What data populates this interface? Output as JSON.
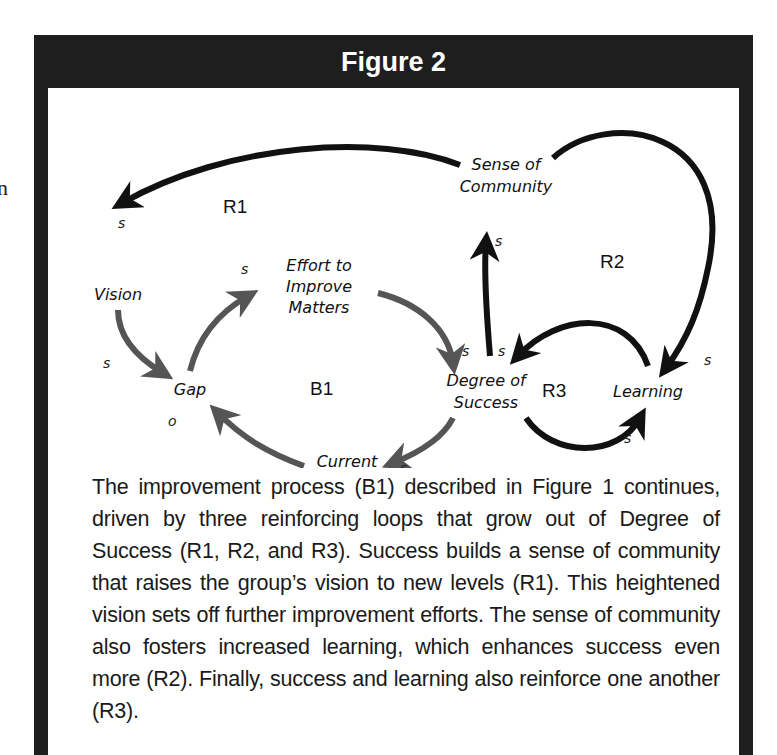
{
  "figure": {
    "title": "Figure 2",
    "stray_text": "n",
    "colors": {
      "frame": "#1e1e1e",
      "reinforcing_arrow": "#111111",
      "balancing_arrow": "#555555",
      "background": "#ffffff"
    },
    "nodes": [
      {
        "id": "vision",
        "lines": [
          "Vision"
        ],
        "x": 70,
        "y": 206
      },
      {
        "id": "effort",
        "lines": [
          "Effort to",
          "Improve",
          "Matters"
        ],
        "x": 258,
        "y": 193
      },
      {
        "id": "sense",
        "lines": [
          "Sense of",
          "Community"
        ],
        "x": 418,
        "y": 124
      },
      {
        "id": "gap",
        "lines": [
          "Gap"
        ],
        "x": 157,
        "y": 307
      },
      {
        "id": "degree",
        "lines": [
          "Degree of",
          "Success"
        ],
        "x": 406,
        "y": 307
      },
      {
        "id": "learning",
        "lines": [
          "Learning"
        ],
        "x": 584,
        "y": 313
      },
      {
        "id": "reality",
        "lines": [
          "Current",
          "Reality"
        ],
        "x": 288,
        "y": 376
      }
    ],
    "loops": [
      {
        "id": "R1",
        "label": "R1",
        "x": 200,
        "y": 147
      },
      {
        "id": "R2",
        "label": "R2",
        "x": 575,
        "y": 194
      },
      {
        "id": "B1",
        "label": "B1",
        "x": 280,
        "y": 312
      },
      {
        "id": "R3",
        "label": "R3",
        "x": 503,
        "y": 318
      }
    ],
    "links": [
      {
        "from": "sense",
        "to": "vision",
        "polarity": "s",
        "loop": "R1",
        "kind": "reinforcing"
      },
      {
        "from": "vision",
        "to": "gap",
        "polarity": "s",
        "loop": "B1",
        "kind": "balancing"
      },
      {
        "from": "gap",
        "to": "effort",
        "polarity": "s",
        "loop": "B1",
        "kind": "balancing"
      },
      {
        "from": "effort",
        "to": "degree",
        "polarity": "s",
        "loop": "B1",
        "kind": "balancing"
      },
      {
        "from": "degree",
        "to": "reality",
        "polarity": "s",
        "loop": "B1",
        "kind": "balancing"
      },
      {
        "from": "reality",
        "to": "gap",
        "polarity": "o",
        "loop": "B1",
        "kind": "balancing"
      },
      {
        "from": "degree",
        "to": "sense",
        "polarity": "s",
        "loop": "R1",
        "kind": "reinforcing"
      },
      {
        "from": "sense",
        "to": "learning",
        "polarity": "s",
        "loop": "R2",
        "kind": "reinforcing"
      },
      {
        "from": "learning",
        "to": "degree",
        "polarity": "s",
        "loop": "R3",
        "kind": "reinforcing"
      },
      {
        "from": "degree",
        "to": "learning",
        "polarity": "s",
        "loop": "R3",
        "kind": "reinforcing"
      }
    ],
    "polarity_labels": [
      {
        "text": "s",
        "x": 73,
        "y": 134
      },
      {
        "text": "s",
        "x": 187,
        "y": 177
      },
      {
        "text": "s",
        "x": 52,
        "y": 272
      },
      {
        "text": "o",
        "x": 117,
        "y": 332
      },
      {
        "text": "s",
        "x": 418,
        "y": 253
      },
      {
        "text": "s",
        "x": 405,
        "y": 282
      },
      {
        "text": "s",
        "x": 438,
        "y": 282
      },
      {
        "text": "s",
        "x": 645,
        "y": 298
      },
      {
        "text": "s",
        "x": 554,
        "y": 360
      },
      {
        "text": "s",
        "x": 337,
        "y": 371
      }
    ],
    "caption": "The improvement process (B1) described in Figure 1 continues, driven by three reinforcing loops that grow out of Degree of Success (R1, R2, and R3). Success builds a sense of community that raises the group’s vision to new levels (R1). This heightened vision sets off further improvement efforts. The sense of community also fosters increased learning, which enhances success even more (R2). Finally, success and learning also reinforce one another (R3)."
  }
}
